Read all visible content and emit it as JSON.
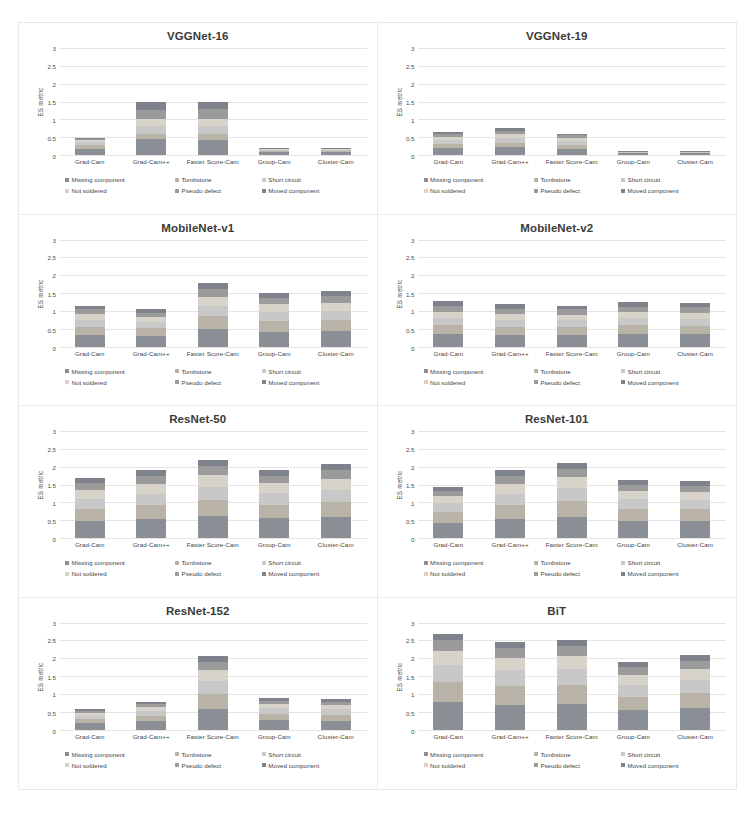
{
  "figure": {
    "axis": {
      "ylabel": "ES metric",
      "yticks": [
        "0",
        "0.5",
        "1",
        "1.5",
        "2",
        "2.5",
        "3"
      ],
      "ymin": 0,
      "ymax": 3
    },
    "categories": [
      "Grad-Cam",
      "Grad-Cam++",
      "Faster Score-Cam",
      "Group-Cam",
      "Cluster-Cam"
    ],
    "legend": [
      {
        "label": "Missing component",
        "color": "#8a8f96"
      },
      {
        "label": "Tombstone",
        "color": "#b9b2a6"
      },
      {
        "label": "Short circuit",
        "color": "#c8c8c8"
      },
      {
        "label": "Not soldered",
        "color": "#d7d3cb"
      },
      {
        "label": "Pseudo defect",
        "color": "#9b9b9b"
      },
      {
        "label": "Moved component",
        "color": "#7e838b"
      }
    ]
  },
  "chart_data": [
    {
      "type": "bar",
      "stacked": true,
      "title": "VGGNet-16",
      "xlabel": "",
      "ylabel": "ES metric",
      "ylim": [
        0,
        3
      ],
      "grid": true,
      "legend_position": "bottom",
      "categories": [
        "Grad-Cam",
        "Grad-Cam++",
        "Faster Score-Cam",
        "Group-Cam",
        "Cluster-Cam"
      ],
      "series": [
        {
          "name": "Missing component",
          "values": [
            0.18,
            0.45,
            0.42,
            0.08,
            0.08
          ]
        },
        {
          "name": "Tombstone",
          "values": [
            0.1,
            0.15,
            0.16,
            0.04,
            0.04
          ]
        },
        {
          "name": "Short circuit",
          "values": [
            0.08,
            0.22,
            0.24,
            0.03,
            0.03
          ]
        },
        {
          "name": "Not soldered",
          "values": [
            0.06,
            0.18,
            0.2,
            0.02,
            0.02
          ]
        },
        {
          "name": "Pseudo defect",
          "values": [
            0.04,
            0.27,
            0.27,
            0.01,
            0.01
          ]
        },
        {
          "name": "Moved component",
          "values": [
            0.02,
            0.23,
            0.21,
            0.02,
            0.02
          ]
        }
      ],
      "totals": [
        0.48,
        1.5,
        1.5,
        0.2,
        0.2
      ]
    },
    {
      "type": "bar",
      "stacked": true,
      "title": "VGGNet-19",
      "xlabel": "",
      "ylabel": "ES metric",
      "ylim": [
        0,
        3
      ],
      "grid": true,
      "legend_position": "bottom",
      "categories": [
        "Grad-Cam",
        "Grad-Cam++",
        "Faster Score-Cam",
        "Group-Cam",
        "Cluster-Cam"
      ],
      "series": [
        {
          "name": "Missing component",
          "values": [
            0.2,
            0.22,
            0.18,
            0.05,
            0.05
          ]
        },
        {
          "name": "Tombstone",
          "values": [
            0.12,
            0.13,
            0.11,
            0.02,
            0.02
          ]
        },
        {
          "name": "Short circuit",
          "values": [
            0.1,
            0.12,
            0.1,
            0.01,
            0.01
          ]
        },
        {
          "name": "Not soldered",
          "values": [
            0.09,
            0.11,
            0.09,
            0.01,
            0.01
          ]
        },
        {
          "name": "Pseudo defect",
          "values": [
            0.08,
            0.09,
            0.07,
            0.005,
            0.005
          ]
        },
        {
          "name": "Moved component",
          "values": [
            0.06,
            0.08,
            0.05,
            0.005,
            0.005
          ]
        }
      ],
      "totals": [
        0.65,
        0.75,
        0.6,
        0.1,
        0.1
      ]
    },
    {
      "type": "bar",
      "stacked": true,
      "title": "MobileNet-v1",
      "xlabel": "",
      "ylabel": "ES metric",
      "ylim": [
        0,
        3
      ],
      "grid": true,
      "legend_position": "bottom",
      "categories": [
        "Grad-Cam",
        "Grad-Cam++",
        "Faster Score-Cam",
        "Group-Cam",
        "Cluster-Cam"
      ],
      "series": [
        {
          "name": "Missing component",
          "values": [
            0.32,
            0.3,
            0.5,
            0.42,
            0.44
          ]
        },
        {
          "name": "Tombstone",
          "values": [
            0.24,
            0.22,
            0.36,
            0.3,
            0.31
          ]
        },
        {
          "name": "Short circuit",
          "values": [
            0.18,
            0.16,
            0.28,
            0.24,
            0.25
          ]
        },
        {
          "name": "Not soldered",
          "values": [
            0.16,
            0.15,
            0.26,
            0.22,
            0.23
          ]
        },
        {
          "name": "Pseudo defect",
          "values": [
            0.14,
            0.12,
            0.22,
            0.18,
            0.19
          ]
        },
        {
          "name": "Moved component",
          "values": [
            0.11,
            0.1,
            0.16,
            0.14,
            0.13
          ]
        }
      ],
      "totals": [
        1.15,
        1.05,
        1.78,
        1.5,
        1.55
      ]
    },
    {
      "type": "bar",
      "stacked": true,
      "title": "MobileNet-v2",
      "xlabel": "",
      "ylabel": "ES metric",
      "ylim": [
        0,
        3
      ],
      "grid": true,
      "legend_position": "bottom",
      "categories": [
        "Grad-Cam",
        "Grad-Cam++",
        "Faster Score-Cam",
        "Group-Cam",
        "Cluster-Cam"
      ],
      "series": [
        {
          "name": "Missing component",
          "values": [
            0.36,
            0.33,
            0.32,
            0.35,
            0.34
          ]
        },
        {
          "name": "Tombstone",
          "values": [
            0.25,
            0.23,
            0.22,
            0.24,
            0.24
          ]
        },
        {
          "name": "Short circuit",
          "values": [
            0.2,
            0.19,
            0.19,
            0.2,
            0.19
          ]
        },
        {
          "name": "Not soldered",
          "values": [
            0.17,
            0.16,
            0.16,
            0.17,
            0.17
          ]
        },
        {
          "name": "Pseudo defect",
          "values": [
            0.16,
            0.15,
            0.15,
            0.16,
            0.16
          ]
        },
        {
          "name": "Moved component",
          "values": [
            0.13,
            0.12,
            0.11,
            0.13,
            0.12
          ]
        }
      ],
      "totals": [
        1.27,
        1.18,
        1.15,
        1.25,
        1.22
      ]
    },
    {
      "type": "bar",
      "stacked": true,
      "title": "ResNet-50",
      "xlabel": "",
      "ylabel": "ES metric",
      "ylim": [
        0,
        3
      ],
      "grid": true,
      "legend_position": "bottom",
      "categories": [
        "Grad-Cam",
        "Grad-Cam++",
        "Faster Score-Cam",
        "Group-Cam",
        "Cluster-Cam"
      ],
      "series": [
        {
          "name": "Missing component",
          "values": [
            0.48,
            0.54,
            0.62,
            0.55,
            0.58
          ]
        },
        {
          "name": "Tombstone",
          "values": [
            0.34,
            0.38,
            0.44,
            0.38,
            0.42
          ]
        },
        {
          "name": "Short circuit",
          "values": [
            0.28,
            0.32,
            0.38,
            0.32,
            0.36
          ]
        },
        {
          "name": "Not soldered",
          "values": [
            0.24,
            0.28,
            0.32,
            0.28,
            0.3
          ]
        },
        {
          "name": "Pseudo defect",
          "values": [
            0.2,
            0.22,
            0.26,
            0.22,
            0.24
          ]
        },
        {
          "name": "Moved component",
          "values": [
            0.14,
            0.16,
            0.16,
            0.17,
            0.18
          ]
        }
      ],
      "totals": [
        1.68,
        1.9,
        2.18,
        1.92,
        2.08
      ]
    },
    {
      "type": "bar",
      "stacked": true,
      "title": "ResNet-101",
      "xlabel": "",
      "ylabel": "ES metric",
      "ylim": [
        0,
        3
      ],
      "grid": true,
      "legend_position": "bottom",
      "categories": [
        "Grad-Cam",
        "Grad-Cam++",
        "Faster Score-Cam",
        "Group-Cam",
        "Cluster-Cam"
      ],
      "series": [
        {
          "name": "Missing component",
          "values": [
            0.42,
            0.54,
            0.6,
            0.48,
            0.47
          ]
        },
        {
          "name": "Tombstone",
          "values": [
            0.3,
            0.38,
            0.43,
            0.33,
            0.33
          ]
        },
        {
          "name": "Short circuit",
          "values": [
            0.25,
            0.32,
            0.36,
            0.28,
            0.27
          ]
        },
        {
          "name": "Not soldered",
          "values": [
            0.2,
            0.28,
            0.32,
            0.23,
            0.23
          ]
        },
        {
          "name": "Pseudo defect",
          "values": [
            0.15,
            0.22,
            0.24,
            0.17,
            0.17
          ]
        },
        {
          "name": "Moved component",
          "values": [
            0.11,
            0.16,
            0.15,
            0.13,
            0.13
          ]
        }
      ],
      "totals": [
        1.43,
        1.9,
        2.1,
        1.62,
        1.6
      ]
    },
    {
      "type": "bar",
      "stacked": true,
      "title": "ResNet-152",
      "xlabel": "",
      "ylabel": "ES metric",
      "ylim": [
        0,
        3
      ],
      "grid": true,
      "legend_position": "bottom",
      "categories": [
        "Grad-Cam",
        "Grad-Cam++",
        "Faster Score-Cam",
        "Group-Cam",
        "Cluster-Cam"
      ],
      "series": [
        {
          "name": "Missing component",
          "values": [
            0.17,
            0.23,
            0.58,
            0.26,
            0.25
          ]
        },
        {
          "name": "Tombstone",
          "values": [
            0.12,
            0.16,
            0.42,
            0.18,
            0.17
          ]
        },
        {
          "name": "Short circuit",
          "values": [
            0.1,
            0.13,
            0.36,
            0.15,
            0.15
          ]
        },
        {
          "name": "Not soldered",
          "values": [
            0.08,
            0.11,
            0.3,
            0.12,
            0.12
          ]
        },
        {
          "name": "Pseudo defect",
          "values": [
            0.06,
            0.08,
            0.24,
            0.1,
            0.09
          ]
        },
        {
          "name": "Moved component",
          "values": [
            0.04,
            0.06,
            0.17,
            0.07,
            0.07
          ]
        }
      ],
      "totals": [
        0.57,
        0.77,
        2.07,
        0.88,
        0.85
      ]
    },
    {
      "type": "bar",
      "stacked": true,
      "title": "BiT",
      "xlabel": "",
      "ylabel": "ES metric",
      "ylim": [
        0,
        3
      ],
      "grid": true,
      "legend_position": "bottom",
      "categories": [
        "Grad-Cam",
        "Grad-Cam++",
        "Faster Score-Cam",
        "Group-Cam",
        "Cluster-Cam"
      ],
      "series": [
        {
          "name": "Missing component",
          "values": [
            0.78,
            0.7,
            0.72,
            0.54,
            0.6
          ]
        },
        {
          "name": "Tombstone",
          "values": [
            0.55,
            0.52,
            0.53,
            0.38,
            0.43
          ]
        },
        {
          "name": "Short circuit",
          "values": [
            0.48,
            0.44,
            0.45,
            0.34,
            0.37
          ]
        },
        {
          "name": "Not soldered",
          "values": [
            0.4,
            0.36,
            0.37,
            0.28,
            0.3
          ]
        },
        {
          "name": "Pseudo defect",
          "values": [
            0.29,
            0.26,
            0.27,
            0.2,
            0.22
          ]
        },
        {
          "name": "Moved component",
          "values": [
            0.17,
            0.17,
            0.16,
            0.14,
            0.16
          ]
        }
      ],
      "totals": [
        2.67,
        2.45,
        2.5,
        1.88,
        2.08
      ]
    }
  ]
}
